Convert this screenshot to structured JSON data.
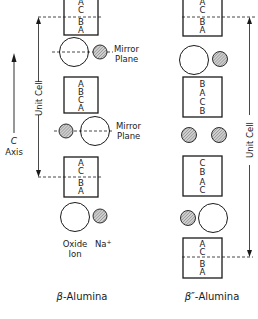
{
  "diagram": {
    "left": {
      "title": "β-Alumina",
      "title_prefix": "β",
      "title_suffix": "-Alumina",
      "blocks": [
        {
          "letters": [
            "A",
            "C",
            "B",
            "A"
          ]
        },
        {
          "letters": [
            "A",
            "B",
            "C",
            "A"
          ]
        },
        {
          "letters": [
            "A",
            "C",
            "B",
            "A"
          ]
        }
      ],
      "mirror_plane_label_1": "Mirror",
      "mirror_plane_label_2": "Plane",
      "unit_cell_label": "Unit Cell",
      "c_axis_label_1": "C",
      "c_axis_label_2": "Axis",
      "legend": {
        "oxide_label_1": "Oxide",
        "oxide_label_2": "Ion",
        "sodium_label": "Na",
        "sodium_charge": "+"
      }
    },
    "right": {
      "title": "β″-Alumina",
      "title_prefix": "β″",
      "title_suffix": "-Alumina",
      "blocks": [
        {
          "letters": [
            "A",
            "C",
            "B",
            "A"
          ]
        },
        {
          "letters": [
            "B",
            "A",
            "C",
            "B"
          ]
        },
        {
          "letters": [
            "C",
            "B",
            "A",
            "C"
          ]
        },
        {
          "letters": [
            "A",
            "C",
            "B",
            "A"
          ]
        }
      ],
      "unit_cell_label": "Unit Cell"
    },
    "colors": {
      "line": "#1a1a1a",
      "hatch_fill": "#b8b8b8",
      "background": "#ffffff"
    }
  }
}
